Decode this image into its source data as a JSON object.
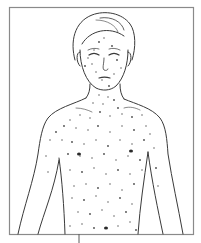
{
  "figure": {
    "caption": "",
    "colors": {
      "background": "#ffffff",
      "frame": "#8a8a8a",
      "line": "#3a3a3a",
      "spot": "#4a4a4a"
    }
  },
  "spots": [
    [
      99,
      42
    ],
    [
      104,
      38
    ],
    [
      94,
      50
    ],
    [
      112,
      46
    ],
    [
      88,
      58
    ],
    [
      92,
      64
    ],
    [
      117,
      60
    ],
    [
      121,
      68
    ],
    [
      96,
      72
    ],
    [
      85,
      66
    ],
    [
      114,
      74
    ],
    [
      102,
      80
    ],
    [
      109,
      86
    ],
    [
      99,
      95
    ],
    [
      108,
      97
    ],
    [
      114,
      100
    ],
    [
      103,
      104
    ],
    [
      93,
      103
    ],
    [
      118,
      108
    ],
    [
      80,
      115
    ],
    [
      90,
      118
    ],
    [
      100,
      112
    ],
    [
      110,
      116
    ],
    [
      122,
      114
    ],
    [
      132,
      117
    ],
    [
      142,
      115
    ],
    [
      70,
      120
    ],
    [
      64,
      126
    ],
    [
      76,
      128
    ],
    [
      88,
      130
    ],
    [
      98,
      126
    ],
    [
      110,
      132
    ],
    [
      122,
      126
    ],
    [
      134,
      130
    ],
    [
      146,
      126
    ],
    [
      150,
      134
    ],
    [
      56,
      132
    ],
    [
      50,
      140
    ],
    [
      62,
      140
    ],
    [
      72,
      142
    ],
    [
      84,
      144
    ],
    [
      96,
      140
    ],
    [
      108,
      146
    ],
    [
      120,
      140
    ],
    [
      132,
      144
    ],
    [
      144,
      140
    ],
    [
      154,
      148
    ],
    [
      46,
      156
    ],
    [
      68,
      154
    ],
    [
      80,
      156
    ],
    [
      92,
      158
    ],
    [
      104,
      154
    ],
    [
      116,
      160
    ],
    [
      128,
      156
    ],
    [
      140,
      160
    ],
    [
      48,
      172
    ],
    [
      70,
      170
    ],
    [
      82,
      172
    ],
    [
      94,
      168
    ],
    [
      106,
      174
    ],
    [
      118,
      170
    ],
    [
      130,
      174
    ],
    [
      142,
      170
    ],
    [
      156,
      168
    ],
    [
      74,
      186
    ],
    [
      86,
      184
    ],
    [
      98,
      188
    ],
    [
      110,
      184
    ],
    [
      122,
      190
    ],
    [
      134,
      184
    ],
    [
      158,
      186
    ],
    [
      72,
      198
    ],
    [
      84,
      200
    ],
    [
      96,
      196
    ],
    [
      108,
      202
    ],
    [
      120,
      198
    ],
    [
      132,
      204
    ],
    [
      78,
      212
    ],
    [
      90,
      214
    ],
    [
      102,
      210
    ],
    [
      114,
      216
    ],
    [
      126,
      212
    ],
    [
      70,
      226
    ],
    [
      82,
      224
    ],
    [
      94,
      228
    ],
    [
      118,
      226
    ],
    [
      130,
      222
    ],
    [
      136,
      230
    ]
  ],
  "large_spots": [
    [
      79,
      154
    ],
    [
      131,
      151
    ],
    [
      106,
      228
    ]
  ]
}
